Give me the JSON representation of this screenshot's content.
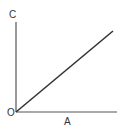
{
  "diagram": {
    "labels": {
      "y_axis": "C",
      "origin": "O",
      "x_axis": "A"
    },
    "colors": {
      "axis": "#555555",
      "line": "#333333",
      "text": "#333333"
    },
    "geometry": {
      "origin": [
        16,
        112
      ],
      "y_axis_end": [
        16,
        22
      ],
      "x_axis_end": [
        117,
        112
      ],
      "line_end": [
        113,
        31
      ]
    }
  }
}
